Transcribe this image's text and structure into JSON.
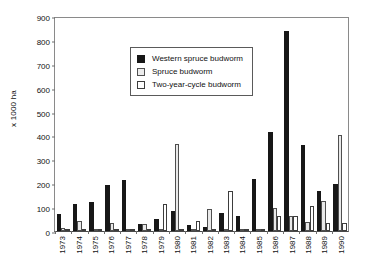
{
  "chart_data": {
    "type": "bar",
    "title": "",
    "xlabel": "",
    "ylabel": "x 1000 ha",
    "ylim": [
      0,
      900
    ],
    "yticks": [
      0,
      100,
      200,
      300,
      400,
      500,
      600,
      700,
      800,
      900
    ],
    "grid": false,
    "legend_position": "upper-left-inside",
    "categories": [
      "1973",
      "1974",
      "1975",
      "1976",
      "1977",
      "1978",
      "1979",
      "1980",
      "1981",
      "1982",
      "1983",
      "1984",
      "1985",
      "1986",
      "1987",
      "1988",
      "1989",
      "1990"
    ],
    "series": [
      {
        "name": "Western spruce budworm",
        "color": "#171717",
        "values": [
          73,
          111,
          122,
          191,
          215,
          30,
          51,
          83,
          24,
          17,
          76,
          64,
          217,
          414,
          836,
          361,
          168,
          197
        ]
      },
      {
        "name": "Spruce budworm",
        "color": "#ececec",
        "values": [
          12,
          40,
          2,
          34,
          0,
          30,
          0,
          365,
          0,
          91,
          0,
          0,
          10,
          97,
          63,
          39,
          127,
          400
        ]
      },
      {
        "name": "Two-year-cycle budworm",
        "color": "#ffffff",
        "values": [
          1,
          0,
          0,
          0,
          0,
          0,
          115,
          0,
          40,
          0,
          169,
          6,
          8,
          62,
          62,
          104,
          32,
          35
        ]
      }
    ]
  },
  "legend": {
    "items": [
      {
        "label": "Western spruce budworm",
        "swatch": "filled-black-square"
      },
      {
        "label": "Spruce budworm",
        "swatch": "light-gray-square"
      },
      {
        "label": "Two-year-cycle budworm",
        "swatch": "white-square"
      }
    ]
  }
}
